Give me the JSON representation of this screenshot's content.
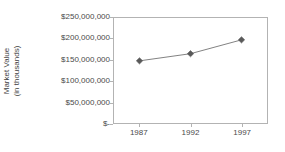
{
  "chart_data": {
    "type": "line",
    "title": "",
    "xlabel": "",
    "ylabel": "Market Value\n(in thousands)",
    "ylabel_line1": "Market Value",
    "ylabel_line2": "(in thousands)",
    "categories": [
      "1987",
      "1992",
      "1997"
    ],
    "x": [
      1987,
      1992,
      1997
    ],
    "values": [
      148000000,
      165000000,
      198000000
    ],
    "series": [
      {
        "name": "Market Value",
        "values": [
          148000000,
          165000000,
          198000000
        ]
      }
    ],
    "ylim": [
      0,
      250000000
    ],
    "y_ticks": [
      0,
      50000000,
      100000000,
      150000000,
      200000000,
      250000000
    ],
    "y_tick_labels": [
      "$-",
      "$50,000,000",
      "$100,000,000",
      "$150,000,000",
      "$200,000,000",
      "$250,000,000"
    ],
    "x_tick_labels": [
      "1987",
      "1992",
      "1997"
    ],
    "grid": false,
    "legend": "none",
    "marker": "diamond",
    "marker_color": "#595959",
    "line_color": "#808080",
    "frame_color": "#b3b3b3",
    "background": "#ffffff"
  }
}
